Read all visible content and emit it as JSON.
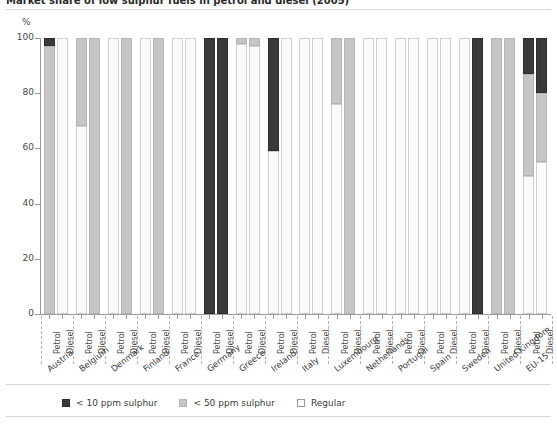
{
  "title": "Market share of low sulphur fuels in petrol and diesel (2005)",
  "axis": {
    "y_unit": "%",
    "y_ticks": [
      "100",
      "80",
      "60",
      "40",
      "20",
      "0"
    ],
    "fuel_labels": [
      "Petrol",
      "Diesel"
    ]
  },
  "legend": {
    "items": [
      {
        "label": "< 10 ppm sulphur",
        "swatch": "s10",
        "color": "#3a3a3a"
      },
      {
        "label": "< 50 ppm sulphur",
        "swatch": "s50",
        "color": "#c6c6c6"
      },
      {
        "label": "Regular",
        "swatch": "reg",
        "color": "#ffffff"
      }
    ]
  },
  "chart_data": {
    "type": "bar",
    "title": "Market share of low sulphur fuels in petrol and diesel (2005)",
    "xlabel": "",
    "ylabel": "%",
    "ylim": [
      0,
      100
    ],
    "yticks": [
      0,
      20,
      40,
      60,
      80,
      100
    ],
    "grid": false,
    "legend_position": "bottom",
    "stacked": true,
    "categories": [
      "Austria",
      "Belgium",
      "Denmark",
      "Finland",
      "France",
      "Germany",
      "Greece",
      "Ireland",
      "Italy",
      "Luxembourg",
      "Netherlands",
      "Portugal",
      "Spain",
      "Sweden",
      "United Kingdom",
      "EU-15"
    ],
    "subcategories": [
      "Petrol",
      "Diesel"
    ],
    "series": [
      {
        "name": "< 10 ppm sulphur",
        "color": "#3a3a3a"
      },
      {
        "name": "< 50 ppm sulphur",
        "color": "#c6c6c6"
      },
      {
        "name": "Regular",
        "color": "#fbfbfb"
      }
    ],
    "bars": [
      {
        "country": "Austria",
        "fuel": "Petrol",
        "s10": 3,
        "s50": 97,
        "regular": 0
      },
      {
        "country": "Austria",
        "fuel": "Diesel",
        "s10": 0,
        "s50": 0,
        "regular": 100
      },
      {
        "country": "Belgium",
        "fuel": "Petrol",
        "s10": 0,
        "s50": 32,
        "regular": 68
      },
      {
        "country": "Belgium",
        "fuel": "Diesel",
        "s10": 0,
        "s50": 100,
        "regular": 0
      },
      {
        "country": "Denmark",
        "fuel": "Petrol",
        "s10": 0,
        "s50": 0,
        "regular": 100
      },
      {
        "country": "Denmark",
        "fuel": "Diesel",
        "s10": 0,
        "s50": 100,
        "regular": 0
      },
      {
        "country": "Finland",
        "fuel": "Petrol",
        "s10": 0,
        "s50": 0,
        "regular": 100
      },
      {
        "country": "Finland",
        "fuel": "Diesel",
        "s10": 0,
        "s50": 100,
        "regular": 0
      },
      {
        "country": "France",
        "fuel": "Petrol",
        "s10": 0,
        "s50": 0,
        "regular": 100
      },
      {
        "country": "France",
        "fuel": "Diesel",
        "s10": 0,
        "s50": 0,
        "regular": 100
      },
      {
        "country": "Germany",
        "fuel": "Petrol",
        "s10": 100,
        "s50": 0,
        "regular": 0
      },
      {
        "country": "Germany",
        "fuel": "Diesel",
        "s10": 100,
        "s50": 0,
        "regular": 0
      },
      {
        "country": "Greece",
        "fuel": "Petrol",
        "s10": 0,
        "s50": 2,
        "regular": 98
      },
      {
        "country": "Greece",
        "fuel": "Diesel",
        "s10": 0,
        "s50": 3,
        "regular": 97
      },
      {
        "country": "Ireland",
        "fuel": "Petrol",
        "s10": 41,
        "s50": 0,
        "regular": 59
      },
      {
        "country": "Ireland",
        "fuel": "Diesel",
        "s10": 0,
        "s50": 0,
        "regular": 100
      },
      {
        "country": "Italy",
        "fuel": "Petrol",
        "s10": 0,
        "s50": 0,
        "regular": 100
      },
      {
        "country": "Italy",
        "fuel": "Diesel",
        "s10": 0,
        "s50": 0,
        "regular": 100
      },
      {
        "country": "Luxembourg",
        "fuel": "Petrol",
        "s10": 0,
        "s50": 24,
        "regular": 76
      },
      {
        "country": "Luxembourg",
        "fuel": "Diesel",
        "s10": 0,
        "s50": 100,
        "regular": 0
      },
      {
        "country": "Netherlands",
        "fuel": "Petrol",
        "s10": 0,
        "s50": 0,
        "regular": 100
      },
      {
        "country": "Netherlands",
        "fuel": "Diesel",
        "s10": 0,
        "s50": 0,
        "regular": 100
      },
      {
        "country": "Portugal",
        "fuel": "Petrol",
        "s10": 0,
        "s50": 0,
        "regular": 100
      },
      {
        "country": "Portugal",
        "fuel": "Diesel",
        "s10": 0,
        "s50": 0,
        "regular": 100
      },
      {
        "country": "Spain",
        "fuel": "Petrol",
        "s10": 0,
        "s50": 0,
        "regular": 100
      },
      {
        "country": "Spain",
        "fuel": "Diesel",
        "s10": 0,
        "s50": 0,
        "regular": 100
      },
      {
        "country": "Sweden",
        "fuel": "Petrol",
        "s10": 0,
        "s50": 0,
        "regular": 100
      },
      {
        "country": "Sweden",
        "fuel": "Diesel",
        "s10": 100,
        "s50": 0,
        "regular": 0
      },
      {
        "country": "United Kingdom",
        "fuel": "Petrol",
        "s10": 0,
        "s50": 100,
        "regular": 0
      },
      {
        "country": "United Kingdom",
        "fuel": "Diesel",
        "s10": 0,
        "s50": 100,
        "regular": 0
      },
      {
        "country": "EU-15",
        "fuel": "Petrol",
        "s10": 13,
        "s50": 37,
        "regular": 50
      },
      {
        "country": "EU-15",
        "fuel": "Diesel",
        "s10": 20,
        "s50": 25,
        "regular": 55
      }
    ]
  }
}
